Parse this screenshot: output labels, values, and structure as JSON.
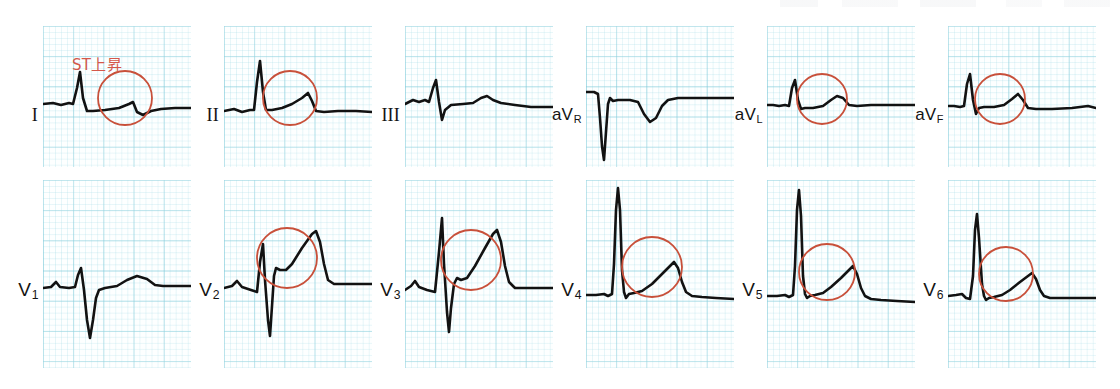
{
  "figure": {
    "kind": "12-lead-ecg",
    "annotation": {
      "text": "ST上昇",
      "color": "#d4584a"
    },
    "colors": {
      "trace": "#121212",
      "highlight_circle": "#c8503a",
      "grid_major": "#78c8d7",
      "grid_minor": "#96d7e4",
      "paper": "#fdffff"
    }
  },
  "rows": [
    {
      "name": "limb-leads",
      "panels": [
        {
          "label_html": "I",
          "label_kind": "roman",
          "highlighted": true
        },
        {
          "label_html": "II",
          "label_kind": "roman",
          "highlighted": true
        },
        {
          "label_html": "III",
          "label_kind": "roman",
          "highlighted": false
        },
        {
          "label_html": "aVR",
          "label_kind": "av",
          "highlighted": false
        },
        {
          "label_html": "aVL",
          "label_kind": "av",
          "highlighted": true
        },
        {
          "label_html": "aVF",
          "label_kind": "av",
          "highlighted": true
        }
      ]
    },
    {
      "name": "precordial-leads",
      "panels": [
        {
          "label_html": "V1",
          "label_kind": "v",
          "highlighted": false
        },
        {
          "label_html": "V2",
          "label_kind": "v",
          "highlighted": true
        },
        {
          "label_html": "V3",
          "label_kind": "v",
          "highlighted": true
        },
        {
          "label_html": "V4",
          "label_kind": "v",
          "highlighted": true
        },
        {
          "label_html": "V5",
          "label_kind": "v",
          "highlighted": true
        },
        {
          "label_html": "V6",
          "label_kind": "v",
          "highlighted": true
        }
      ]
    }
  ],
  "chart_data": {
    "type": "line",
    "title": "",
    "xlabel": "",
    "ylabel": "",
    "leads": [
      {
        "lead": "I",
        "row": 0,
        "col": 0,
        "st_elevation": true,
        "circle": {
          "cx": 82,
          "cy": 72,
          "r": 27
        },
        "path": "M0,78 L10,77 L18,79 L26,77 L30,78 L34,62 L37,46 L40,72 L44,85 L50,85 L62,84 L76,82 L86,78 L90,76 L94,86 L100,89 L108,85 L118,83 L132,82 L148,82"
      },
      {
        "lead": "II",
        "row": 0,
        "col": 1,
        "st_elevation": true,
        "circle": {
          "cx": 66,
          "cy": 72,
          "r": 27
        },
        "path": "M0,85 L10,83 L18,86 L26,84 L30,84 L33,56 L36,35 L39,66 L42,84 L48,84 L58,82 L68,78 L78,72 L84,67 L88,75 L92,85 L100,86 L114,85 L132,85 L148,86"
      },
      {
        "lead": "III",
        "row": 0,
        "col": 2,
        "st_elevation": false,
        "circle": null,
        "path": "M0,78 L8,74 L14,76 L20,74 L24,76 L28,62 L31,54 L34,76 L37,94 L40,84 L46,79 L58,78 L68,77 L76,72 L82,70 L88,74 L96,77 L110,79 L126,81 L140,81 L148,81"
      },
      {
        "lead": "aVR",
        "row": 0,
        "col": 3,
        "st_elevation": false,
        "circle": null,
        "path": "M0,66 L8,66 L12,68 L14,92 L16,120 L18,134 L20,106 L22,78 L24,72 L27,75 L32,74 L44,74 L52,76 L58,88 L64,96 L70,92 L76,80 L82,74 L92,72 L110,72 L130,72 L148,72"
      },
      {
        "lead": "aVL",
        "row": 0,
        "col": 4,
        "st_elevation": true,
        "circle": {
          "cx": 55,
          "cy": 73,
          "r": 25
        },
        "path": "M0,79 L6,79 L12,80 L18,79 L22,80 L25,62 L28,54 L31,74 L34,83 L38,82 L46,82 L56,80 L64,74 L70,70 L76,72 L82,79 L90,80 L104,79 L122,79 L148,79"
      },
      {
        "lead": "aVF",
        "row": 0,
        "col": 5,
        "st_elevation": true,
        "circle": {
          "cx": 52,
          "cy": 73,
          "r": 25
        },
        "path": "M0,80 L6,80 L12,81 L16,80 L19,58 L22,48 L25,74 L28,88 L31,82 L36,81 L46,81 L56,79 L64,73 L70,68 L75,74 L80,82 L88,83 L104,83 L124,82 L140,80 L148,82"
      },
      {
        "lead": "V1",
        "row": 1,
        "col": 0,
        "st_elevation": false,
        "circle": null,
        "path": "M0,108 L8,107 L13,102 L17,107 L26,108 L32,107 L35,95 L38,88 L41,110 L44,140 L47,158 L50,140 L53,118 L56,110 L62,108 L74,106 L84,100 L94,96 L104,99 L112,105 L120,106 L134,106 L148,106"
      },
      {
        "lead": "V2",
        "row": 1,
        "col": 1,
        "st_elevation": true,
        "circle": {
          "cx": 63,
          "cy": 78,
          "r": 30
        },
        "path": "M0,108 L8,106 L13,101 L18,107 L27,110 L33,112 L36,82 L39,64 L41,100 L44,140 L46,156 L48,126 L50,96 L52,88 L56,90 L62,90 L68,84 L78,68 L88,54 L92,51 L96,62 L100,84 L104,100 L110,104 L122,104 L136,104 L148,104"
      },
      {
        "lead": "V3",
        "row": 1,
        "col": 2,
        "st_elevation": true,
        "circle": {
          "cx": 66,
          "cy": 80,
          "r": 30
        },
        "path": "M0,110 L6,106 L10,101 L14,107 L22,110 L30,112 L34,72 L37,38 L39,84 L42,132 L44,152 L46,128 L49,104 L52,98 L56,100 L62,98 L70,86 L80,68 L88,54 L92,50 L96,62 L100,86 L104,102 L110,108 L122,108 L136,108 L148,108"
      },
      {
        "lead": "V4",
        "row": 1,
        "col": 3,
        "st_elevation": true,
        "circle": {
          "cx": 66,
          "cy": 87,
          "r": 30
        },
        "path": "M0,115 L10,115 L18,114 L22,116 L26,114 L28,84 L30,30 L32,8 L34,30 L36,90 L38,112 L40,118 L43,114 L48,113 L56,111 L66,104 L76,94 L84,86 L88,82 L92,88 L96,102 L100,112 L106,116 L116,117 L130,118 L148,119"
      },
      {
        "lead": "V5",
        "row": 1,
        "col": 4,
        "st_elevation": true,
        "circle": {
          "cx": 60,
          "cy": 92,
          "r": 28
        },
        "path": "M0,116 L10,116 L18,115 L22,117 L26,115 L28,86 L30,30 L32,10 L34,36 L36,96 L38,114 L40,118 L43,116 L48,115 L56,113 L64,107 L74,98 L82,90 L86,86 L90,94 L94,108 L98,116 L104,119 L114,120 L130,121 L148,122"
      },
      {
        "lead": "V6",
        "row": 1,
        "col": 5,
        "st_elevation": true,
        "circle": {
          "cx": 58,
          "cy": 94,
          "r": 27
        },
        "path": "M0,116 L8,115 L14,114 L18,118 L22,119 L25,96 L27,50 L29,34 L31,58 L34,104 L36,116 L38,120 L41,118 L46,117 L54,115 L62,110 L72,102 L80,96 L84,93 L88,99 L92,110 L96,116 L102,118 L114,118 L130,118 L148,118"
      }
    ]
  }
}
